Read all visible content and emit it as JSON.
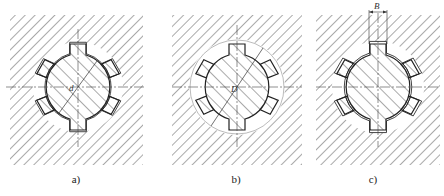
{
  "figure": {
    "panels": [
      {
        "id": "a",
        "caption": "a)",
        "dimension_label": "d",
        "description": "spline shaft centred on minor diameter d"
      },
      {
        "id": "b",
        "caption": "b)",
        "dimension_label": "D",
        "description": "spline shaft centred on major diameter D"
      },
      {
        "id": "c",
        "caption": "c)",
        "dimension_label": "B",
        "description": "spline shaft centred on tooth width B"
      }
    ],
    "spline_teeth_count": 6,
    "colors": {
      "line": "#222222",
      "hatch": "#555555",
      "background": "#ffffff"
    }
  }
}
